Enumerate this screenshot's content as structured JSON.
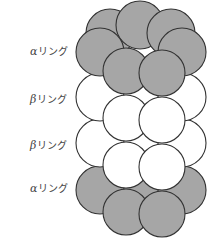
{
  "diagram": {
    "type": "proteasome-ring-stack",
    "labels": [
      {
        "greek": "α",
        "text": "リング",
        "y": 51
      },
      {
        "greek": "β",
        "text": "リング",
        "y": 99
      },
      {
        "greek": "β",
        "text": "リング",
        "y": 145
      },
      {
        "greek": "α",
        "text": "リング",
        "y": 188
      }
    ],
    "colors": {
      "alpha_fill": "#a6a6a6",
      "beta_fill": "#ffffff",
      "stroke": "#333333"
    },
    "rings": [
      {
        "kind": "alpha",
        "circles": [
          {
            "cx": 110,
            "cy": 33,
            "r": 24
          },
          {
            "cx": 140,
            "cy": 25,
            "r": 24
          },
          {
            "cx": 171,
            "cy": 33,
            "r": 24
          },
          {
            "cx": 100,
            "cy": 52,
            "r": 24
          },
          {
            "cx": 182,
            "cy": 52,
            "r": 24
          },
          {
            "cx": 126,
            "cy": 71,
            "r": 23
          },
          {
            "cx": 162,
            "cy": 73,
            "r": 23
          }
        ]
      },
      {
        "kind": "beta",
        "circles": [
          {
            "cx": 100,
            "cy": 97,
            "r": 24
          },
          {
            "cx": 182,
            "cy": 97,
            "r": 24
          },
          {
            "cx": 126,
            "cy": 118,
            "r": 23
          },
          {
            "cx": 162,
            "cy": 120,
            "r": 23
          }
        ]
      },
      {
        "kind": "beta",
        "circles": [
          {
            "cx": 100,
            "cy": 143,
            "r": 24
          },
          {
            "cx": 182,
            "cy": 143,
            "r": 24
          },
          {
            "cx": 126,
            "cy": 165,
            "r": 23
          },
          {
            "cx": 162,
            "cy": 167,
            "r": 23
          }
        ]
      },
      {
        "kind": "alpha",
        "circles": [
          {
            "cx": 141,
            "cy": 195,
            "r": 22
          },
          {
            "cx": 100,
            "cy": 190,
            "r": 24
          },
          {
            "cx": 182,
            "cy": 190,
            "r": 24
          },
          {
            "cx": 126,
            "cy": 212,
            "r": 23
          },
          {
            "cx": 162,
            "cy": 214,
            "r": 23
          }
        ]
      }
    ]
  }
}
